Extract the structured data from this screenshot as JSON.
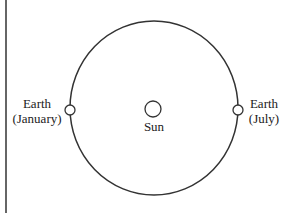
{
  "diagram": {
    "type": "orbit-diagram",
    "orbit": {
      "cx": 154,
      "cy": 108,
      "rx": 84,
      "ry": 87,
      "stroke": "#333333"
    },
    "sun": {
      "cx": 153,
      "cy": 109,
      "r": 8,
      "label": "Sun"
    },
    "earth_left": {
      "cx": 70,
      "cy": 110,
      "r": 5,
      "label_line1": "Earth",
      "label_line2": "(January)"
    },
    "earth_right": {
      "cx": 238,
      "cy": 110,
      "r": 5,
      "label_line1": "Earth",
      "label_line2": "(July)"
    },
    "left_border_line": {
      "x": 6,
      "color": "#333333"
    }
  }
}
